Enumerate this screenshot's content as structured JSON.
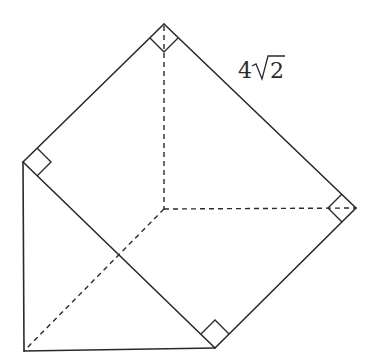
{
  "figure": {
    "type": "3d-solid-triangular-prism",
    "stroke_color": "#2a2a2a",
    "background": "#ffffff",
    "vertices": {
      "top": [
        164,
        24
      ],
      "left": [
        23,
        162
      ],
      "right": [
        356,
        208
      ],
      "bottom_right": [
        215,
        348
      ],
      "bottom_left": [
        24,
        351
      ],
      "hidden_center": [
        164,
        209
      ]
    },
    "solid_edges": [
      [
        "top",
        "left"
      ],
      [
        "top",
        "right"
      ],
      [
        "right",
        "bottom_right"
      ],
      [
        "left",
        "bottom_right"
      ],
      [
        "left",
        "bottom_left"
      ],
      [
        "bottom_left",
        "bottom_right"
      ]
    ],
    "dashed_edges": [
      [
        "top",
        "hidden_center"
      ],
      [
        "hidden_center",
        "right"
      ],
      [
        "hidden_center",
        "bottom_left"
      ]
    ],
    "right_angle_markers": [
      "top",
      "left",
      "right",
      "bottom_right"
    ],
    "labels": [
      {
        "text_prefix": "4",
        "radicand": "2",
        "full": "4√2",
        "near_edge": "top-right"
      }
    ]
  }
}
